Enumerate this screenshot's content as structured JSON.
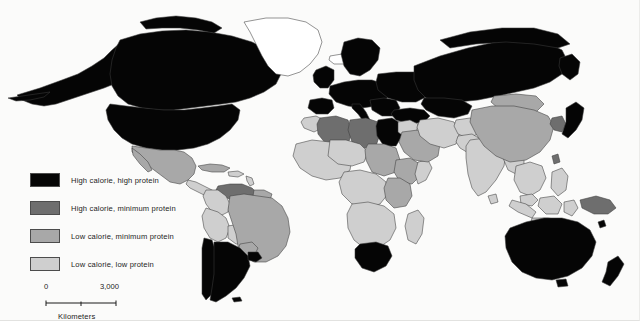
{
  "figure": {
    "type": "choropleth-world-map",
    "projection": "equirectangular",
    "background_color": "#fbfbfa"
  },
  "legend": {
    "items": [
      {
        "label": "High calorie, high protein",
        "color": "#050505",
        "class_key": "high-cal-high-prot"
      },
      {
        "label": "High calorie, minimum protein",
        "color": "#6e6e6e",
        "class_key": "high-cal-min-prot"
      },
      {
        "label": "Low calorie, minimum protein",
        "color": "#a8a8a8",
        "class_key": "low-cal-min-prot"
      },
      {
        "label": "Low calorie, low protein",
        "color": "#cfcfcf",
        "class_key": "low-cal-low-prot"
      }
    ]
  },
  "scalebar": {
    "min_label": "0",
    "max_label": "3,000",
    "units_caption": "Kilometers"
  },
  "map": {
    "no_data_color": "#ffffff",
    "border_color": "#3d3d3d",
    "regions": [
      {
        "name": "Canada",
        "class_key": "high-cal-high-prot"
      },
      {
        "name": "Alaska",
        "class_key": "high-cal-high-prot"
      },
      {
        "name": "United States",
        "class_key": "high-cal-high-prot"
      },
      {
        "name": "Greenland",
        "class_key": "no-data"
      },
      {
        "name": "Mexico",
        "class_key": "low-cal-min-prot"
      },
      {
        "name": "Central America",
        "class_key": "low-cal-low-prot"
      },
      {
        "name": "Cuba",
        "class_key": "low-cal-min-prot"
      },
      {
        "name": "Caribbean",
        "class_key": "low-cal-low-prot"
      },
      {
        "name": "Venezuela",
        "class_key": "high-cal-min-prot"
      },
      {
        "name": "Colombia",
        "class_key": "low-cal-low-prot"
      },
      {
        "name": "Peru",
        "class_key": "low-cal-low-prot"
      },
      {
        "name": "Bolivia",
        "class_key": "low-cal-low-prot"
      },
      {
        "name": "Brazil",
        "class_key": "low-cal-min-prot"
      },
      {
        "name": "Chile",
        "class_key": "high-cal-high-prot"
      },
      {
        "name": "Argentina",
        "class_key": "high-cal-high-prot"
      },
      {
        "name": "Uruguay",
        "class_key": "high-cal-high-prot"
      },
      {
        "name": "Paraguay",
        "class_key": "low-cal-min-prot"
      },
      {
        "name": "Western Europe",
        "class_key": "high-cal-high-prot"
      },
      {
        "name": "Scandinavia",
        "class_key": "high-cal-high-prot"
      },
      {
        "name": "Eastern Europe",
        "class_key": "high-cal-high-prot"
      },
      {
        "name": "Russia",
        "class_key": "high-cal-high-prot"
      },
      {
        "name": "Turkey",
        "class_key": "high-cal-high-prot"
      },
      {
        "name": "Morocco",
        "class_key": "low-cal-low-prot"
      },
      {
        "name": "Algeria",
        "class_key": "high-cal-min-prot"
      },
      {
        "name": "Libya",
        "class_key": "high-cal-min-prot"
      },
      {
        "name": "Egypt",
        "class_key": "high-cal-high-prot"
      },
      {
        "name": "Sudan",
        "class_key": "low-cal-min-prot"
      },
      {
        "name": "Ethiopia",
        "class_key": "low-cal-min-prot"
      },
      {
        "name": "West Africa",
        "class_key": "low-cal-low-prot"
      },
      {
        "name": "Central Africa",
        "class_key": "low-cal-low-prot"
      },
      {
        "name": "East Africa",
        "class_key": "low-cal-low-prot"
      },
      {
        "name": "Southern Africa",
        "class_key": "low-cal-low-prot"
      },
      {
        "name": "South Africa",
        "class_key": "high-cal-high-prot"
      },
      {
        "name": "Madagascar",
        "class_key": "low-cal-low-prot"
      },
      {
        "name": "Saudi Arabia",
        "class_key": "low-cal-min-prot"
      },
      {
        "name": "Middle East",
        "class_key": "low-cal-low-prot"
      },
      {
        "name": "Iran",
        "class_key": "low-cal-low-prot"
      },
      {
        "name": "India",
        "class_key": "low-cal-low-prot"
      },
      {
        "name": "Pakistan",
        "class_key": "low-cal-low-prot"
      },
      {
        "name": "China",
        "class_key": "low-cal-min-prot"
      },
      {
        "name": "Mongolia",
        "class_key": "low-cal-min-prot"
      },
      {
        "name": "Japan",
        "class_key": "high-cal-high-prot"
      },
      {
        "name": "Korea",
        "class_key": "high-cal-min-prot"
      },
      {
        "name": "Southeast Asia",
        "class_key": "low-cal-low-prot"
      },
      {
        "name": "Indonesia",
        "class_key": "low-cal-low-prot"
      },
      {
        "name": "Philippines",
        "class_key": "low-cal-low-prot"
      },
      {
        "name": "Papua New Guinea",
        "class_key": "high-cal-min-prot"
      },
      {
        "name": "Australia",
        "class_key": "high-cal-high-prot"
      },
      {
        "name": "New Zealand",
        "class_key": "high-cal-high-prot"
      }
    ]
  }
}
